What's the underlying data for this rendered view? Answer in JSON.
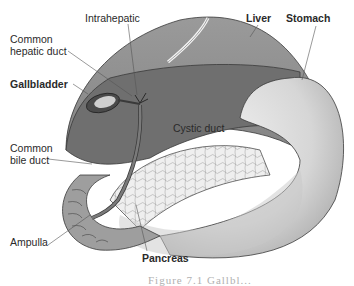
{
  "diagram": {
    "labels": {
      "intrahepatic": "Intrahepatic",
      "common_hepatic_duct_line1": "Common",
      "common_hepatic_duct_line2": "hepatic duct",
      "gallbladder": "Gallbladder",
      "liver": "Liver",
      "stomach": "Stomach",
      "cystic_duct": "Cystic duct",
      "common_bile_duct_line1": "Common",
      "common_bile_duct_line2": "bile duct",
      "ampulla": "Ampulla",
      "pancreas": "Pancreas"
    },
    "caption_fragment": "Figure 7.1 Gallbl...",
    "colors": {
      "liver_upper": "#8c8c8c",
      "liver_lower": "#6e6e6e",
      "stomach": "#dcdcdc",
      "stomach_shade": "#b4b4b4",
      "pancreas": "#ececec",
      "duodenum": "#9a9a9a",
      "outline": "#3a3a3a",
      "leader_line": "#555555"
    }
  }
}
